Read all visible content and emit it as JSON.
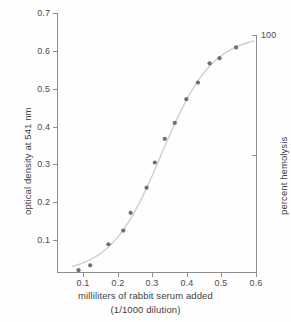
{
  "chart_data": {
    "type": "scatter",
    "title": "",
    "subtitle": "",
    "xlabel": "milliliters of rabbit serum added",
    "xlabel_line2": "(1/1000 dilution)",
    "ylabel": "optical density at 541 nm",
    "y2label": "percent hemolysis",
    "xlim": [
      0.0,
      0.6
    ],
    "ylim": [
      0.0,
      0.7
    ],
    "y2lim": [
      0,
      110
    ],
    "grid": false,
    "legend": "none",
    "has_fit_curve": true,
    "fit_curve_description": "sigmoid dose-response curve through the points",
    "marker_color": "#6f6f6f",
    "curve_color": "#cfcfcf",
    "axis_color": "#8d8d8d",
    "x_ticks": [
      0.1,
      0.2,
      0.3,
      0.4,
      0.5,
      0.6
    ],
    "x_tick_labels": [
      "0.1",
      "0.2",
      "0.3",
      "0.4",
      "0.5",
      "0.6"
    ],
    "y_ticks": [
      0.1,
      0.2,
      0.3,
      0.4,
      0.5,
      0.6,
      0.7
    ],
    "y_tick_labels": [
      "0.1",
      "0.2",
      "0.3",
      "0.4",
      "0.5",
      "0.6",
      "0.7"
    ],
    "y2_ticks": [
      100
    ],
    "y2_tick_labels": [
      "100"
    ],
    "y2_unlabeled_ticks": [
      50
    ],
    "x": [
      0.065,
      0.1,
      0.155,
      0.2,
      0.222,
      0.27,
      0.295,
      0.325,
      0.355,
      0.39,
      0.425,
      0.46,
      0.49,
      0.54
    ],
    "values": [
      0.005,
      0.018,
      0.075,
      0.112,
      0.16,
      0.228,
      0.296,
      0.36,
      0.403,
      0.467,
      0.512,
      0.564,
      0.578,
      0.607
    ],
    "points": [
      {
        "x": 0.065,
        "y": 0.005
      },
      {
        "x": 0.1,
        "y": 0.018
      },
      {
        "x": 0.155,
        "y": 0.075
      },
      {
        "x": 0.2,
        "y": 0.112
      },
      {
        "x": 0.222,
        "y": 0.16
      },
      {
        "x": 0.27,
        "y": 0.228
      },
      {
        "x": 0.295,
        "y": 0.296
      },
      {
        "x": 0.325,
        "y": 0.36
      },
      {
        "x": 0.355,
        "y": 0.403
      },
      {
        "x": 0.39,
        "y": 0.467
      },
      {
        "x": 0.425,
        "y": 0.512
      },
      {
        "x": 0.46,
        "y": 0.564
      },
      {
        "x": 0.49,
        "y": 0.578
      },
      {
        "x": 0.54,
        "y": 0.607
      }
    ]
  },
  "ticklabels": {
    "y": [
      "0.7",
      "0.6",
      "0.5",
      "0.4",
      "0.3",
      "0.2",
      "0.1"
    ],
    "x": [
      "0.1",
      "0.2",
      "0.3",
      "0.4",
      "0.5",
      "0.6"
    ],
    "y2": [
      "100"
    ]
  },
  "labels": {
    "y_axis_title": "optical density at 541 nm",
    "y2_axis_title": "percent hemolysis",
    "x_axis_title_line1": "milliliters of rabbit serum added",
    "x_axis_title_line2": "(1/1000 dilution)"
  }
}
